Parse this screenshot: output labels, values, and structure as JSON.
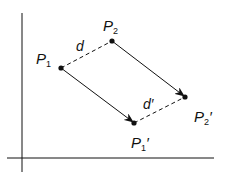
{
  "diagram": {
    "colors": {
      "ink": "#111111",
      "background": "#ffffff"
    },
    "axes": {
      "vertical": {
        "x": 22,
        "y1": 13,
        "y2": 172
      },
      "horizontal": {
        "y": 158,
        "x1": 7,
        "x2": 214
      }
    },
    "points": [
      {
        "id": "P1",
        "label": "P",
        "subscript": "1",
        "prime": "",
        "x": 61,
        "y": 68
      },
      {
        "id": "P2",
        "label": "P",
        "subscript": "2",
        "prime": "",
        "x": 112,
        "y": 41
      },
      {
        "id": "P1p",
        "label": "P",
        "subscript": "1",
        "prime": "′",
        "x": 134,
        "y": 123
      },
      {
        "id": "P2p",
        "label": "P",
        "subscript": "2",
        "prime": "′",
        "x": 185,
        "y": 97
      }
    ],
    "segments": [
      {
        "from": "P1",
        "to": "P2",
        "style": "dashed",
        "label": "d"
      },
      {
        "from": "P1p",
        "to": "P2p",
        "style": "dashed",
        "label": "d′"
      }
    ],
    "arrows": [
      {
        "from": "P1",
        "to": "P1p"
      },
      {
        "from": "P2",
        "to": "P2p"
      }
    ],
    "labels": {
      "p1": {
        "main": "P",
        "sub": "1",
        "prime": ""
      },
      "p2": {
        "main": "P",
        "sub": "2",
        "prime": ""
      },
      "p1p": {
        "main": "P",
        "sub": "1",
        "prime": "′"
      },
      "p2p": {
        "main": "P",
        "sub": "2",
        "prime": "′"
      },
      "d": "d",
      "dp": "d′"
    }
  }
}
